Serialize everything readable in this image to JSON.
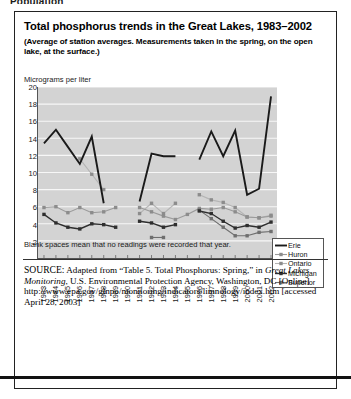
{
  "cut_header": "Population",
  "figure": {
    "title": "Total phosphorus trends in the Great Lakes, 1983–2002",
    "subtitle": "(Average of station averages. Measurements taken in the spring, on the open lake, at the surface.)",
    "axis_title": "Micrograms per liter",
    "note": "Blank spaces mean that no readings were recorded that year.",
    "source_prefix": "SOURCE:",
    "source_text_1": " Adapted from “Table 5. Total Phosphorus: Spring,” in ",
    "source_italic_1": "Great Lakes Monitoring",
    "source_text_2": ", U.S. Environmental Protection Agency, Washington, DC [Online] http://www.epa.gov/glnpo/monitoring/indicators/limnology/index.htm [accessed April 28, 2003]"
  },
  "colors": {
    "plot_background": "#d3d3d3",
    "gridline": "#f7f7f7",
    "erie": "#1a1a1a",
    "huron": "#9a9a9a",
    "ontario": "#b4b4b4",
    "michigan": "#2e2e2e",
    "superior": "#6f6f6f",
    "axis": "#555555"
  },
  "chart_data": {
    "type": "line",
    "title": "Total phosphorus trends in the Great Lakes, 1983–2002",
    "subtitle": "(Average of station averages. Measurements taken in the spring, on the open lake, at the surface.)",
    "xlabel": "",
    "ylabel": "Micrograms per liter",
    "ylim": [
      0,
      20
    ],
    "yticks": [
      20,
      18,
      16,
      14,
      12,
      10,
      8,
      6,
      4,
      2
    ],
    "grid": true,
    "legend_position": "right-middle",
    "annotation": "Blank spaces mean that no readings were recorded that year.",
    "categories": [
      "1983",
      "1984",
      "1985",
      "1986",
      "1987",
      "1988",
      "1989",
      "1990",
      "1991",
      "1992",
      "1993",
      "1994",
      "1995",
      "1996",
      "1997",
      "1998",
      "1999",
      "2000",
      "2001",
      "2002"
    ],
    "series": [
      {
        "name": "Erie",
        "marker": "none",
        "values": [
          13.4,
          15.0,
          13.0,
          11.0,
          14.2,
          6.4,
          null,
          null,
          6.6,
          12.2,
          11.9,
          11.9,
          null,
          11.5,
          14.8,
          11.9,
          14.9,
          7.4,
          8.1,
          18.9
        ]
      },
      {
        "name": "Huron",
        "marker": "square",
        "values": [
          5.9,
          6.0,
          5.3,
          5.9,
          5.3,
          5.4,
          5.9,
          null,
          5.9,
          5.4,
          4.9,
          4.5,
          5.1,
          5.8,
          5.7,
          5.9,
          5.4,
          4.8,
          4.7,
          4.9
        ]
      },
      {
        "name": "Ontario",
        "marker": "square",
        "values": [
          null,
          null,
          null,
          11.6,
          9.8,
          8.0,
          null,
          null,
          5.2,
          6.4,
          5.2,
          6.4,
          null,
          7.4,
          6.8,
          6.5,
          5.9,
          4.8,
          4.7,
          5.0
        ]
      },
      {
        "name": "Michigan",
        "marker": "square",
        "values": [
          5.1,
          4.1,
          3.6,
          3.4,
          4.0,
          3.9,
          3.6,
          null,
          4.3,
          4.1,
          3.6,
          3.9,
          null,
          5.5,
          5.2,
          4.3,
          3.5,
          3.8,
          3.6,
          4.2
        ]
      },
      {
        "name": "Superior",
        "marker": "square",
        "values": [
          null,
          null,
          null,
          null,
          null,
          null,
          null,
          null,
          null,
          2.4,
          2.4,
          null,
          null,
          5.6,
          4.6,
          3.6,
          2.6,
          2.6,
          3.0,
          3.1
        ]
      }
    ]
  },
  "legend": {
    "items": [
      {
        "label": "Erie",
        "style": "thick-plain"
      },
      {
        "label": "Huron",
        "style": "thin-marker"
      },
      {
        "label": "Ontario",
        "style": "thin-marker"
      },
      {
        "label": "Michigan",
        "style": "thin-marker"
      },
      {
        "label": "Superior",
        "style": "thin-marker"
      }
    ]
  }
}
